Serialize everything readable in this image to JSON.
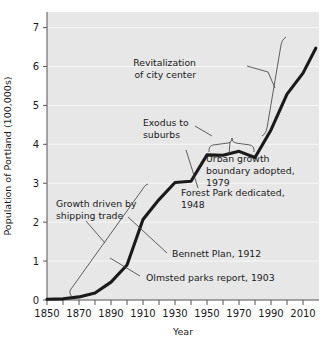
{
  "chart_data": {
    "type": "line",
    "title": "",
    "xlabel": "Year",
    "ylabel": "Population of Portland (100,000s)",
    "xlim": [
      1850,
      2020
    ],
    "ylim": [
      0,
      7.4
    ],
    "grid": true,
    "legend": "none",
    "x_ticks_major": [
      "1850",
      "1870",
      "1890",
      "1910",
      "1930",
      "1950",
      "1970",
      "1990",
      "2010"
    ],
    "x_ticks_major_values": [
      1850,
      1870,
      1890,
      1910,
      1930,
      1950,
      1970,
      1990,
      2010
    ],
    "x_ticks_minor_values": [
      1860,
      1880,
      1900,
      1920,
      1940,
      1960,
      1980,
      2000
    ],
    "y_ticks": [
      "0",
      "1",
      "2",
      "3",
      "4",
      "5",
      "6",
      "7"
    ],
    "y_ticks_values": [
      0,
      1,
      2,
      3,
      4,
      5,
      6,
      7
    ],
    "series": [
      {
        "name": "Population of Portland",
        "x": [
          1850,
          1860,
          1870,
          1880,
          1890,
          1900,
          1910,
          1920,
          1930,
          1940,
          1950,
          1960,
          1970,
          1980,
          1990,
          2000,
          2010,
          2018
        ],
        "values": [
          0.02,
          0.03,
          0.08,
          0.18,
          0.46,
          0.9,
          2.07,
          2.58,
          3.02,
          3.05,
          3.73,
          3.72,
          3.82,
          3.66,
          4.37,
          5.29,
          5.83,
          6.47
        ]
      }
    ],
    "annotations": [
      {
        "id": "revitalization",
        "text_lines": [
          "Revitalization",
          "of city center"
        ],
        "target_year": 1996,
        "target_value": 5.3
      },
      {
        "id": "exodus",
        "text_lines": [
          "Exodus to",
          "suburbs"
        ],
        "target_year": 1965,
        "target_value": 3.9
      },
      {
        "id": "urban-growth",
        "text_lines": [
          "Urban growth",
          "boundary adopted,",
          "1979"
        ],
        "target_year": 1980,
        "target_value": 3.66
      },
      {
        "id": "forest-park",
        "text_lines": [
          "Forest Park dedicated,",
          "1948"
        ],
        "target_year": 1948,
        "target_value": 3.6
      },
      {
        "id": "bennett-plan",
        "text_lines": [
          "Bennett Plan, 1912"
        ],
        "target_year": 1913,
        "target_value": 2.2
      },
      {
        "id": "olmsted",
        "text_lines": [
          "Olmsted parks report, 1903"
        ],
        "target_year": 1905,
        "target_value": 1.45
      },
      {
        "id": "shipping",
        "text_lines": [
          "Growth driven by",
          "shipping trade"
        ],
        "target_year": 1870,
        "target_value": 0.2
      }
    ]
  },
  "style": {
    "plot_background": "#e7e7e7",
    "line_color": "#1a1a1a",
    "grid_color": "#f7f7f7",
    "axis_color": "#555555",
    "leader_color": "#3a3a3a"
  }
}
